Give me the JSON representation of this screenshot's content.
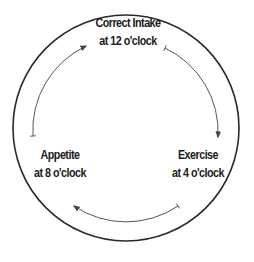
{
  "diagram": {
    "type": "cycle",
    "colors": {
      "outer_circle": "#2a2a2a",
      "inner_arrows": "#555555",
      "text": "#1a1a1a",
      "background": "#ffffff"
    },
    "nodes": [
      {
        "id": "correct-intake",
        "title": "Correct Intake",
        "subtitle": "at 12 o'clock"
      },
      {
        "id": "exercise",
        "title": "Exercise",
        "subtitle": "at 4 o'clock"
      },
      {
        "id": "appetite",
        "title": "Appetite",
        "subtitle": "at 8 o'clock"
      }
    ],
    "edges": [
      {
        "from": "correct-intake",
        "to": "exercise",
        "direction": "clockwise"
      },
      {
        "from": "exercise",
        "to": "appetite",
        "direction": "clockwise"
      },
      {
        "from": "appetite",
        "to": "correct-intake",
        "direction": "clockwise"
      }
    ]
  }
}
